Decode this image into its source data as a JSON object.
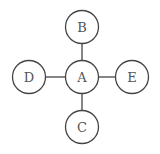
{
  "diagram": {
    "type": "star-graph",
    "stroke_color": "#444444",
    "label_color": "#555555",
    "background": "#ffffff",
    "nodes": [
      {
        "id": "A",
        "label": "A",
        "cx": 82,
        "cy": 77,
        "r": 16.5
      },
      {
        "id": "B",
        "label": "B",
        "cx": 82,
        "cy": 27,
        "r": 16.5
      },
      {
        "id": "C",
        "label": "C",
        "cx": 82,
        "cy": 127,
        "r": 16.5
      },
      {
        "id": "D",
        "label": "D",
        "cx": 29,
        "cy": 77,
        "r": 16.5
      },
      {
        "id": "E",
        "label": "E",
        "cx": 132,
        "cy": 77,
        "r": 16.5
      }
    ],
    "edges": [
      {
        "from": "A",
        "to": "B"
      },
      {
        "from": "A",
        "to": "C"
      },
      {
        "from": "A",
        "to": "D"
      },
      {
        "from": "A",
        "to": "E"
      }
    ]
  }
}
